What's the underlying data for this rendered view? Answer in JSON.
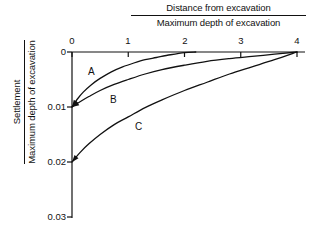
{
  "chart_data": {
    "type": "line",
    "title": "",
    "xlabel": "Distance from excavation / Maximum depth of excavation",
    "ylabel": "Settlement / Maximum depth of excavation",
    "xlabel_numerator": "Distance from excavation",
    "xlabel_denominator": "Maximum depth of excavation",
    "ylabel_numerator": "Settlement",
    "ylabel_denominator": "Maximum depth of excavation",
    "xlim": [
      0,
      4
    ],
    "ylim": [
      0,
      0.03
    ],
    "y_axis_inverted": true,
    "grid": false,
    "legend": "none",
    "x_ticks": [
      "0",
      "1",
      "2",
      "3",
      "4"
    ],
    "x_tick_values": [
      0,
      1,
      2,
      3,
      4
    ],
    "y_ticks": [
      "0",
      "0.01",
      "0.02",
      "0.03"
    ],
    "y_tick_values": [
      0,
      0.01,
      0.02,
      0.03
    ],
    "annotations": [
      {
        "text": "A",
        "x": 0.35,
        "y": 0.0037
      },
      {
        "text": "B",
        "x": 0.72,
        "y": 0.0088
      },
      {
        "text": "C",
        "x": 1.18,
        "y": 0.0137
      }
    ],
    "series": [
      {
        "name": "A",
        "label": "A",
        "x": [
          0.0,
          0.1,
          0.2,
          0.35,
          0.5,
          0.7,
          0.9,
          1.1,
          1.3,
          1.5,
          1.75,
          2.0,
          2.2
        ],
        "values": [
          0.01,
          0.0085,
          0.0073,
          0.0059,
          0.0048,
          0.0036,
          0.0027,
          0.002,
          0.0014,
          0.001,
          0.0005,
          0.0001,
          0.0
        ]
      },
      {
        "name": "B",
        "label": "B",
        "x": [
          0.0,
          0.15,
          0.3,
          0.5,
          0.75,
          1.0,
          1.3,
          1.6,
          2.0,
          2.4,
          2.8,
          3.2,
          3.6,
          4.0
        ],
        "values": [
          0.01,
          0.009,
          0.0081,
          0.007,
          0.0059,
          0.005,
          0.004,
          0.0032,
          0.0024,
          0.0017,
          0.0012,
          0.0008,
          0.0004,
          0.0
        ]
      },
      {
        "name": "C",
        "label": "C",
        "x": [
          0.0,
          0.15,
          0.3,
          0.5,
          0.75,
          1.0,
          1.3,
          1.6,
          2.0,
          2.4,
          2.8,
          3.2,
          3.6,
          4.0
        ],
        "values": [
          0.02,
          0.0182,
          0.0167,
          0.015,
          0.0132,
          0.0118,
          0.0101,
          0.0087,
          0.007,
          0.0055,
          0.004,
          0.0027,
          0.0014,
          0.0
        ]
      }
    ],
    "colors": {
      "axis": "#111111",
      "curve": "#111111",
      "background": "#ffffff"
    }
  },
  "axis": {
    "x_tick_0": "0",
    "x_tick_1": "1",
    "x_tick_2": "2",
    "x_tick_3": "3",
    "x_tick_4": "4",
    "y_tick_0": "0",
    "y_tick_1": "0.01",
    "y_tick_2": "0.02",
    "y_tick_3": "0.03"
  },
  "labels": {
    "curve_a": "A",
    "curve_b": "B",
    "curve_c": "C"
  },
  "title": {
    "numerator": "Distance from excavation",
    "denominator": "Maximum depth of excavation"
  },
  "ylabel": {
    "numerator": "Settlement",
    "denominator": "Maximum depth of excavation"
  }
}
